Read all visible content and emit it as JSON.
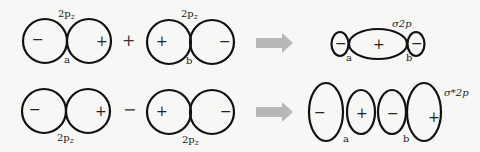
{
  "row1": {
    "orbital_label_1": "2p",
    "orbital_sub_1": "z",
    "orbital_label_2": "2p",
    "orbital_sub_2": "z",
    "atom_a": "a",
    "atom_b": "b",
    "operator": "+",
    "signs_left": [
      "−",
      "+"
    ],
    "signs_right": [
      "+",
      "−"
    ],
    "result_label": "σ2p",
    "result_signs": [
      "−",
      "+",
      "−"
    ]
  },
  "row2": {
    "orbital_label_1": "2p",
    "orbital_sub_1": "z",
    "orbital_label_2": "2p",
    "orbital_sub_2": "z",
    "atom_a": "a",
    "atom_b": "b",
    "operator": "−",
    "signs_left": [
      "−",
      "+"
    ],
    "signs_right": [
      "+",
      "−"
    ],
    "result_label": "σ*2p",
    "result_signs": [
      "−",
      "+",
      "−",
      "+"
    ]
  },
  "colors": {
    "stroke": "#111111",
    "arrow": "#b5b5b5",
    "background": "#f7f7f5"
  }
}
